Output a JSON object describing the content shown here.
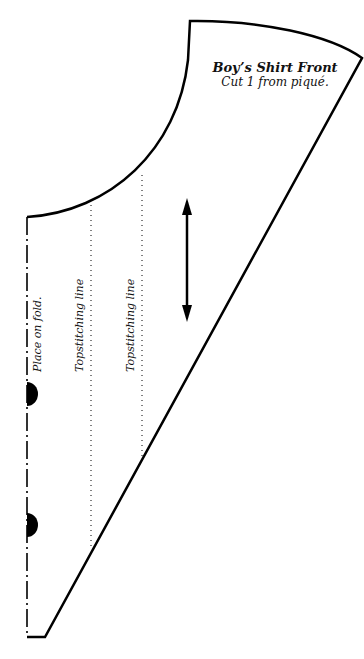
{
  "pattern": {
    "title": "Boy’s Shirt Front",
    "instruction": "Cut 1 from piqué.",
    "fold_label": "Place on fold.",
    "topstitch_labels": [
      "Topstitching line",
      "Topstitching line"
    ],
    "line_color": "#000000",
    "background": "#ffffff"
  },
  "markers": {
    "grainline": "double-headed vertical arrow",
    "notches": 2
  }
}
